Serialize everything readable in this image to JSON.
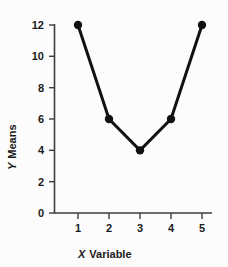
{
  "chart_data": {
    "type": "line",
    "title": "",
    "xlabel": "X Variable",
    "ylabel": "Y Means",
    "x": [
      1,
      2,
      3,
      4,
      5
    ],
    "values": [
      12,
      6,
      4,
      6,
      12
    ],
    "series": [
      {
        "name": "Y Means",
        "values": [
          12,
          6,
          4,
          6,
          12
        ]
      }
    ],
    "xtick_labels": [
      "1",
      "2",
      "3",
      "4",
      "5"
    ],
    "ytick_labels": [
      "0",
      "2",
      "4",
      "6",
      "8",
      "10",
      "12"
    ],
    "ytick_values": [
      0,
      2,
      4,
      6,
      8,
      10,
      12
    ],
    "xlim": [
      0.5,
      5.5
    ],
    "ylim": [
      0,
      12
    ],
    "grid": false,
    "legend": false,
    "marker": "filled-circle",
    "line_color": "#111111",
    "marker_color": "#111111",
    "axis_color": "#3d3d3d",
    "background_color": "#fcfcfc"
  },
  "axes": {
    "x_title_emphasis": "X",
    "x_title_rest": "Variable",
    "y_title_emphasis": "Y",
    "y_title_rest": "Means"
  }
}
